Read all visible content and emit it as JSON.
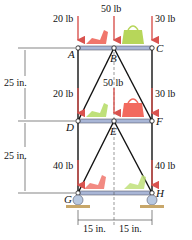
{
  "figure": {
    "nodes": {
      "A": "A",
      "B": "B",
      "C": "C",
      "D": "D",
      "E": "E",
      "F": "F",
      "G": "G",
      "H": "H"
    },
    "loads": {
      "top": [
        "20 lb",
        "50 lb",
        "30 lb"
      ],
      "middle": [
        "20 lb",
        "50 lb",
        "30 lb"
      ],
      "bottom": [
        "40 lb",
        "40 lb"
      ]
    },
    "dimensions": {
      "upper_height": "25 in.",
      "lower_height": "25 in.",
      "left_span": "15 in.",
      "right_span": "15 in."
    },
    "colors": {
      "force_arrow": "#d9534f",
      "beam": "#a9b6d6",
      "shoe_red": "#f0766c",
      "bag_green": "#b7d65a",
      "shoe_green": "#bfe07a",
      "bag_red": "#f26a5e",
      "ground": "#c8a76a",
      "roller": "#b8c8e0"
    }
  }
}
